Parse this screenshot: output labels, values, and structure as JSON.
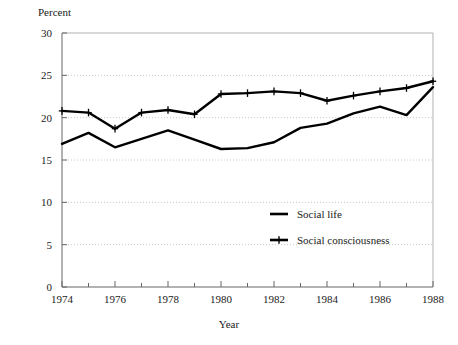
{
  "chart_data": {
    "type": "line",
    "title": "",
    "xlabel": "Year",
    "ylabel": "Percent",
    "xlim": [
      1974,
      1988
    ],
    "ylim": [
      0,
      30
    ],
    "ytick_labels": [
      "0",
      "5",
      "10",
      "15",
      "20",
      "25",
      "30"
    ],
    "ytick_values": [
      0,
      5,
      10,
      15,
      20,
      25,
      30
    ],
    "xtick_labels": [
      "1974",
      "1976",
      "1978",
      "1980",
      "1982",
      "1984",
      "1986",
      "1988"
    ],
    "xtick_values": [
      1974,
      1976,
      1978,
      1980,
      1982,
      1984,
      1986,
      1988
    ],
    "x": [
      1974,
      1975,
      1976,
      1977,
      1978,
      1979,
      1980,
      1981,
      1982,
      1983,
      1984,
      1985,
      1986,
      1987,
      1988
    ],
    "grid": "horizontal-dotted",
    "legend_position": "center-right-inside",
    "series": [
      {
        "name": "Social life",
        "marker": "none",
        "color": "#000000",
        "values": [
          16.9,
          18.2,
          16.5,
          17.5,
          18.5,
          17.4,
          16.3,
          16.4,
          17.1,
          18.8,
          19.3,
          20.5,
          21.3,
          20.3,
          23.6
        ]
      },
      {
        "name": "Social consciousness",
        "marker": "plus",
        "color": "#000000",
        "values": [
          20.8,
          20.6,
          18.7,
          20.6,
          20.9,
          20.4,
          22.8,
          22.9,
          23.1,
          22.9,
          22.0,
          22.6,
          23.1,
          23.5,
          24.3
        ]
      }
    ]
  },
  "legend": {
    "items": [
      {
        "label": "Social life"
      },
      {
        "label": "Social consciousness"
      }
    ]
  },
  "colors": {
    "line": "#000000",
    "grid": "#c8c8c8",
    "frame": "#8a8a8a",
    "text": "#1a1a1a"
  }
}
